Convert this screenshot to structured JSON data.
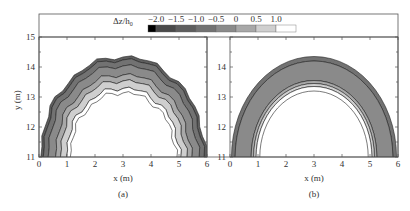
{
  "chart_data": {
    "type": "heatmap",
    "title": "",
    "legend": {
      "label": "Δz/h0",
      "label_display": "Δz/h",
      "label_subscript": "0",
      "ticks": [
        "−2.0",
        "−1.5",
        "−1.0",
        "−0.5",
        "0",
        "0.5",
        "1.0"
      ],
      "levels": [
        -2.0,
        -1.5,
        -1.0,
        -0.5,
        0,
        0.5,
        1.0
      ],
      "colors": [
        "#000000",
        "#4a4a4a",
        "#5e5e5e",
        "#727272",
        "#8a8a8a",
        "#a8a8a8",
        "#cfcfcf",
        "#ffffff"
      ],
      "position": "top"
    },
    "panels": [
      {
        "id": "a",
        "label": "(a)",
        "xlabel": "x (m)",
        "ylabel": "y (m)",
        "xlim": [
          0,
          6
        ],
        "ylim": [
          11,
          15
        ],
        "xticks": [
          "0",
          "1",
          "2",
          "3",
          "4",
          "5",
          "6"
        ],
        "yticks": [
          "11",
          "12",
          "13",
          "14",
          "15"
        ],
        "description": "Semicircular arch-shaped scour/deposition band centered at x=3, outer edge reaching y≈14.35, inner edge y≈13.55; darkest erosion (≈−1.0 to −1.5) along outer edge, lighter (0 to 1.0) toward inner edge near top",
        "bands": [
          {
            "level": -1.5,
            "outer_r": 3.35,
            "inner_r": 3.25
          },
          {
            "level": -1.0,
            "outer_r": 3.25,
            "inner_r": 3.05
          },
          {
            "level": -0.5,
            "outer_r": 3.05,
            "inner_r": 2.75
          },
          {
            "level": 0,
            "outer_r": 2.75,
            "inner_r": 2.55
          },
          {
            "level": 0.5,
            "outer_r": 2.55,
            "inner_r": 2.3
          },
          {
            "level": 1.0,
            "outer_r": 2.3,
            "inner_r": 2.15
          }
        ]
      },
      {
        "id": "b",
        "label": "(b)",
        "xlabel": "x (m)",
        "ylabel": "",
        "xlim": [
          0,
          6
        ],
        "ylim": [
          11,
          15
        ],
        "xticks": [
          "0",
          "1",
          "2",
          "3",
          "4",
          "5",
          "6"
        ],
        "yticks": [
          "11",
          "12",
          "13",
          "14"
        ],
        "description": "Smoother semicircular arch band; outer thin darker ring (≈−1.0), wide mid-gray band (≈−0.5), thin light rings (0 to 1.0) along inner edge",
        "bands": [
          {
            "level": -1.0,
            "outer_r": 3.35,
            "inner_r": 3.2
          },
          {
            "level": -0.5,
            "outer_r": 3.2,
            "inner_r": 2.55
          },
          {
            "level": 0,
            "outer_r": 2.55,
            "inner_r": 2.45
          },
          {
            "level": 0.5,
            "outer_r": 2.45,
            "inner_r": 2.35
          },
          {
            "level": 1.0,
            "outer_r": 2.35,
            "inner_r": 2.2
          }
        ]
      }
    ]
  }
}
